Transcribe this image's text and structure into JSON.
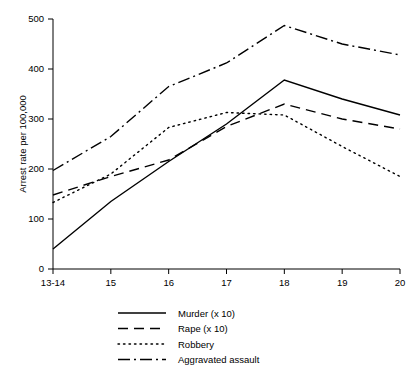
{
  "chart_data": {
    "type": "line",
    "title": "",
    "xlabel": "",
    "ylabel": "Arrest rate per 100,000",
    "categories": [
      "13-14",
      "15",
      "16",
      "17",
      "18",
      "19",
      "20"
    ],
    "x": [
      0,
      1,
      2,
      3,
      4,
      5,
      6
    ],
    "xlim": [
      0,
      6
    ],
    "ylim": [
      0,
      500
    ],
    "yticks": [
      0,
      100,
      200,
      300,
      400,
      500
    ],
    "ytick_labels": [
      "0",
      "100",
      "200",
      "300",
      "400",
      "500"
    ],
    "xtick_labels": [
      "13-14",
      "15",
      "16",
      "17",
      "18",
      "19",
      "20"
    ],
    "grid": false,
    "legend_position": "bottom",
    "series": [
      {
        "name": "Murder (x 10)",
        "style": "solid",
        "dash": "none",
        "color": "#000000",
        "values": [
          40,
          135,
          215,
          290,
          378,
          340,
          308
        ]
      },
      {
        "name": "Rape (x 10)",
        "style": "dashed",
        "dash": "10,6",
        "color": "#000000",
        "values": [
          148,
          185,
          218,
          285,
          330,
          300,
          280
        ]
      },
      {
        "name": "Robbery",
        "style": "dotted",
        "dash": "1.5,4",
        "color": "#000000",
        "values": [
          133,
          190,
          283,
          313,
          308,
          245,
          185
        ]
      },
      {
        "name": "Aggravated assault",
        "style": "dash-dot",
        "dash": "12,4,2,4",
        "color": "#000000",
        "values": [
          197,
          265,
          365,
          412,
          487,
          450,
          428
        ]
      }
    ]
  },
  "axis": {
    "y_title": "Arrest rate per 100,000"
  },
  "legend": {
    "entries": [
      {
        "label": "Murder (x 10)"
      },
      {
        "label": "Rape (x 10)"
      },
      {
        "label": "Robbery"
      },
      {
        "label": "Aggravated assault"
      }
    ]
  }
}
